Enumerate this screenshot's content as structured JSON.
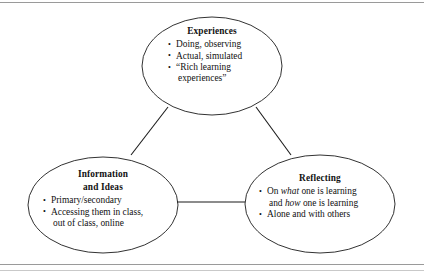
{
  "figure": {
    "background_color": "#ffffff",
    "line_color": "#1b1b1b",
    "rule_color": "#9a9a9a",
    "layout": "triangle"
  },
  "nodes": [
    {
      "id": "experiences",
      "title": "Experiences",
      "bullets": [
        {
          "line1": "Doing, observing",
          "line2": ""
        },
        {
          "line1": "Actual, simulated",
          "line2": ""
        },
        {
          "line1": "“Rich learning",
          "line2": "experiences”"
        }
      ]
    },
    {
      "id": "information",
      "title_line1": "Information",
      "title_line2": "and Ideas",
      "bullets": [
        {
          "line1": "Primary/secondary",
          "line2": ""
        },
        {
          "line1": "Accessing them in class,",
          "line2": "out of class, online"
        }
      ]
    },
    {
      "id": "reflecting",
      "title": "Reflecting",
      "bullets": [
        {
          "pre": "On ",
          "em1": "what",
          "mid": " one is learning",
          "line2_pre": "and ",
          "em2": "how",
          "line2_post": " one is learning"
        },
        {
          "line1": "Alone and with others",
          "line2": ""
        }
      ]
    }
  ],
  "connectors": [
    {
      "from": "experiences",
      "to": "information"
    },
    {
      "from": "experiences",
      "to": "reflecting"
    },
    {
      "from": "information",
      "to": "reflecting"
    }
  ]
}
